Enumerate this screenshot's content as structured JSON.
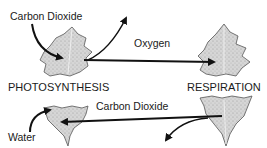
{
  "diagram": {
    "type": "cycle",
    "nodes": [
      {
        "id": "photosynthesis",
        "label": "PHOTOSYNTHESIS",
        "shape": "leaf"
      },
      {
        "id": "respiration",
        "label": "RESPIRATION",
        "shape": "leaf"
      }
    ],
    "edges": [
      {
        "from": "external",
        "to": "photosynthesis",
        "label": "Carbon Dioxide",
        "direction": "in"
      },
      {
        "from": "photosynthesis",
        "to": "external",
        "label": "",
        "direction": "out"
      },
      {
        "from": "photosynthesis",
        "to": "respiration",
        "label": "Oxygen"
      },
      {
        "from": "respiration",
        "to": "photosynthesis",
        "label": "Carbon Dioxide"
      },
      {
        "from": "external",
        "to": "photosynthesis",
        "label": "Water",
        "direction": "in"
      },
      {
        "from": "respiration",
        "to": "external",
        "label": "",
        "direction": "out"
      }
    ]
  },
  "labels": {
    "co2_in": "Carbon Dioxide",
    "oxygen": "Oxygen",
    "photosynthesis": "PHOTOSYNTHESIS",
    "respiration": "RESPIRATION",
    "co2_return": "Carbon Dioxide",
    "water": "Water"
  },
  "colors": {
    "leaf_fill": "#d9d9d9",
    "leaf_stroke": "#555555",
    "arrow": "#111111"
  }
}
